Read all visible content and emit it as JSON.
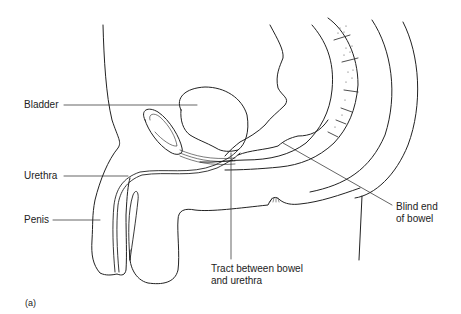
{
  "figure": {
    "panel_label": "(a)",
    "labels": {
      "bladder": "Bladder",
      "urethra": "Urethra",
      "penis": "Penis",
      "blind_end_line1": "Blind end",
      "blind_end_line2": "of bowel",
      "tract_line1": "Tract between bowel",
      "tract_line2": "and urethra"
    }
  }
}
